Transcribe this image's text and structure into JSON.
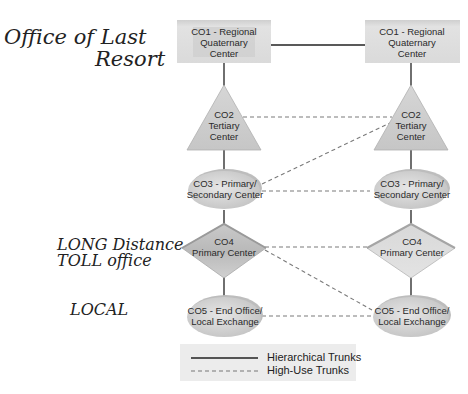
{
  "annotations": {
    "office_last_resort_line1": "Office of Last",
    "office_last_resort_line2": "Resort",
    "long_distance_line1": "LONG Distance",
    "long_distance_line2": "TOLL office",
    "local": "LOCAL"
  },
  "nodes": {
    "co1": {
      "line1": "CO1 - Regional",
      "line2": "Quaternary",
      "line3": "Center"
    },
    "co2": {
      "line1": "CO2",
      "line2": "Tertiary",
      "line3": "Center"
    },
    "co3": {
      "line1": "CO3 - Primary/",
      "line2": "Secondary Center"
    },
    "co4": {
      "line1": "CO4",
      "line2": "Primary Center"
    },
    "co5": {
      "line1": "CO5 - End Office/",
      "line2": "Local Exchange"
    }
  },
  "legend": {
    "hierarchical": "Hierarchical Trunks",
    "high_use": "High-Use Trunks"
  },
  "colors": {
    "node_fill": "#d9d9d9",
    "node_shade": "#b5b5b5",
    "line": "#222222",
    "dashed": "#777777",
    "legend_bg": "#ececec"
  }
}
